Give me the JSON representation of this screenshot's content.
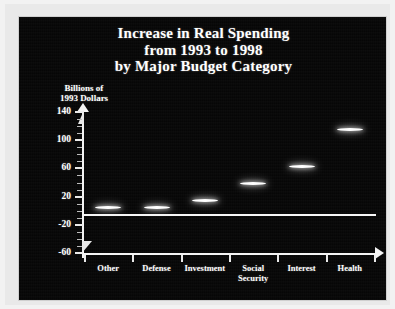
{
  "chart_data": {
    "type": "scatter",
    "title": "Increase in Real Spending from 1993 to 1998 by Major Budget Category",
    "title_lines": [
      "Increase in Real Spending",
      "from 1993 to 1998",
      "by Major Budget Category"
    ],
    "ylabel_lines": [
      "Billions of",
      "1993 Dollars"
    ],
    "ylabel": "Billions of 1993 Dollars",
    "xlabel": "",
    "categories": [
      "Other",
      "Defense",
      "Investment",
      "Social Security",
      "Interest",
      "Health"
    ],
    "category_lines": [
      [
        "Other"
      ],
      [
        "Defense"
      ],
      [
        "Investment"
      ],
      [
        "Social",
        "Security"
      ],
      [
        "Interest"
      ],
      [
        "Health"
      ]
    ],
    "values": [
      5,
      5,
      15,
      38,
      62,
      115
    ],
    "ylim": [
      -60,
      140
    ],
    "yticks": [
      140,
      100,
      60,
      20,
      -20,
      -60
    ],
    "ytick_labels": [
      "140",
      "100",
      "60",
      "20",
      "-20",
      "-60"
    ],
    "minor_tick_step": 10,
    "grid": false,
    "legend": "none",
    "zero_line": 0,
    "marker_style": "horizontal-dash"
  },
  "colors": {
    "plot_background": "#050505",
    "frame_background": "#e9e9e9",
    "axis": "#f4f4f4",
    "text": "#ffffff",
    "marker": "#ffffff"
  }
}
